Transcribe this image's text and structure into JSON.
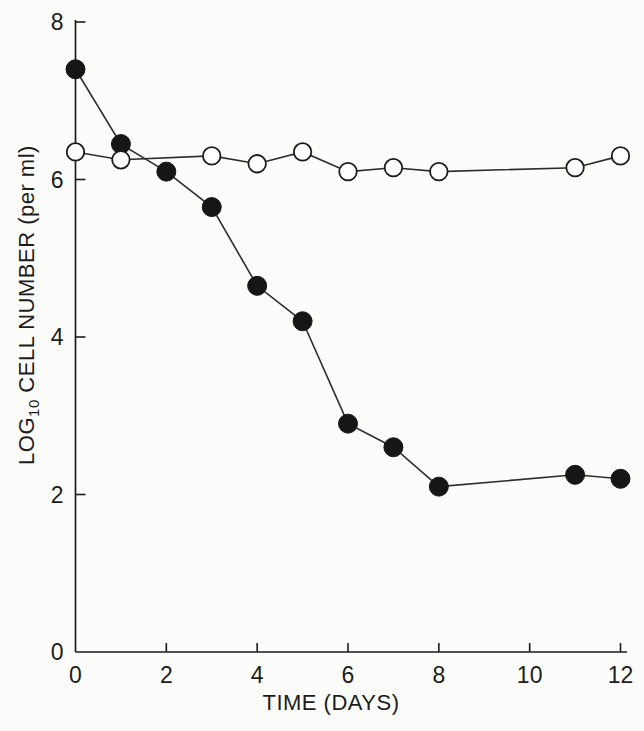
{
  "figure": {
    "background": "#fcfcfa",
    "ink_color": "#1c1c1c",
    "line_color": "#2e2e2e"
  },
  "chart_data": {
    "type": "line",
    "title": "",
    "xlabel": "TIME (DAYS)",
    "ylabel": "LOG10 CELL NUMBER (per ml)",
    "ylabel_parts": {
      "prefix": "LOG",
      "subscript": "10",
      "suffix": " CELL NUMBER (per ml)"
    },
    "xlim": [
      0,
      12
    ],
    "ylim": [
      0,
      8
    ],
    "x_ticks": [
      0,
      2,
      4,
      6,
      8,
      10,
      12
    ],
    "y_ticks": [
      0,
      2,
      4,
      6,
      8
    ],
    "grid": false,
    "legend": "none",
    "series": [
      {
        "name": "open-circle-series",
        "marker": "open-circle",
        "marker_fill": "#ffffff",
        "marker_stroke": "#1c1c1c",
        "x": [
          0,
          1,
          3,
          4,
          5,
          6,
          7,
          8,
          11,
          12
        ],
        "y": [
          6.35,
          6.25,
          6.3,
          6.2,
          6.35,
          6.1,
          6.15,
          6.1,
          6.15,
          6.3
        ]
      },
      {
        "name": "filled-circle-series",
        "marker": "filled-circle",
        "marker_fill": "#161616",
        "marker_stroke": "#161616",
        "x": [
          0,
          1,
          2,
          3,
          4,
          5,
          6,
          7,
          8,
          11,
          12
        ],
        "y": [
          7.4,
          6.45,
          6.1,
          5.65,
          4.65,
          4.2,
          2.9,
          2.6,
          2.1,
          2.25,
          2.2
        ]
      }
    ]
  }
}
